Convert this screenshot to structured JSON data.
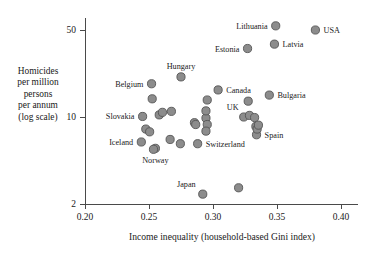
{
  "chart_data": {
    "type": "scatter",
    "title": "",
    "xlabel": "Income inequality (household-based Gini index)",
    "ylabel_lines": [
      "Homicides",
      "per million",
      "persons",
      "per annum",
      "(log scale)"
    ],
    "ylabel": "Homicides per million persons per annum (log scale)",
    "yscale": "log",
    "xscale": "linear",
    "xlim": [
      0.193,
      0.413
    ],
    "ylim": [
      1.85,
      62
    ],
    "xticks": [
      0.2,
      0.25,
      0.3,
      0.35,
      0.4
    ],
    "xtick_labels": [
      "0.20",
      "0.25",
      "0.30",
      "0.35",
      "0.40"
    ],
    "yticks": [
      2,
      10,
      50
    ],
    "ytick_labels": [
      "2",
      "10",
      "50"
    ],
    "grid": false,
    "legend": "none",
    "marker_color": "#8c8c8c",
    "marker_edge_color": "#555555",
    "marker_radius": 4.1,
    "points": [
      {
        "label": "Lithuania",
        "x": 0.349,
        "y": 54.0,
        "label_pos": "left"
      },
      {
        "label": "USA",
        "x": 0.38,
        "y": 50.0,
        "label_pos": "right"
      },
      {
        "label": "Latvia",
        "x": 0.348,
        "y": 38.5,
        "label_pos": "right"
      },
      {
        "label": "Estonia",
        "x": 0.327,
        "y": 35.5,
        "label_pos": "left"
      },
      {
        "label": "Hungary",
        "x": 0.275,
        "y": 21.0,
        "label_pos": "above"
      },
      {
        "label": "Belgium",
        "x": 0.252,
        "y": 18.5,
        "label_pos": "left"
      },
      {
        "label": "Canada",
        "x": 0.304,
        "y": 16.5,
        "label_pos": "right"
      },
      {
        "label": "Bulgaria",
        "x": 0.344,
        "y": 15.0,
        "label_pos": "right"
      },
      {
        "label": "Slovakia",
        "x": 0.245,
        "y": 10.1,
        "label_pos": "left"
      },
      {
        "label": "UK",
        "x": 0.324,
        "y": 10.0,
        "label_pos": "above-left"
      },
      {
        "label": "Spain",
        "x": 0.334,
        "y": 7.2,
        "label_pos": "right"
      },
      {
        "label": "Iceland",
        "x": 0.244,
        "y": 6.3,
        "label_pos": "left"
      },
      {
        "label": "Norway",
        "x": 0.255,
        "y": 5.6,
        "label_pos": "below"
      },
      {
        "label": "Switzerland",
        "x": 0.288,
        "y": 6.1,
        "label_pos": "right"
      },
      {
        "label": "Japan",
        "x": 0.292,
        "y": 2.4,
        "label_pos": "above-right"
      },
      {
        "label": "",
        "x": 0.2525,
        "y": 14.0
      },
      {
        "label": "",
        "x": 0.258,
        "y": 10.4
      },
      {
        "label": "",
        "x": 0.2605,
        "y": 10.9
      },
      {
        "label": "",
        "x": 0.2675,
        "y": 11.1
      },
      {
        "label": "",
        "x": 0.2475,
        "y": 8.0
      },
      {
        "label": "",
        "x": 0.2505,
        "y": 7.6
      },
      {
        "label": "",
        "x": 0.2535,
        "y": 5.5
      },
      {
        "label": "",
        "x": 0.2665,
        "y": 6.6
      },
      {
        "label": "",
        "x": 0.2745,
        "y": 6.1
      },
      {
        "label": "",
        "x": 0.2855,
        "y": 9.0
      },
      {
        "label": "",
        "x": 0.2865,
        "y": 8.7
      },
      {
        "label": "",
        "x": 0.2945,
        "y": 9.8
      },
      {
        "label": "",
        "x": 0.2955,
        "y": 8.7
      },
      {
        "label": "",
        "x": 0.2945,
        "y": 7.7
      },
      {
        "label": "",
        "x": 0.2945,
        "y": 11.2
      },
      {
        "label": "",
        "x": 0.2955,
        "y": 13.7
      },
      {
        "label": "",
        "x": 0.3275,
        "y": 13.4
      },
      {
        "label": "",
        "x": 0.3285,
        "y": 10.3
      },
      {
        "label": "",
        "x": 0.3325,
        "y": 9.9
      },
      {
        "label": "",
        "x": 0.3335,
        "y": 8.4
      },
      {
        "label": "",
        "x": 0.3345,
        "y": 8.0
      },
      {
        "label": "",
        "x": 0.3355,
        "y": 8.6
      },
      {
        "label": "",
        "x": 0.32,
        "y": 2.7
      }
    ]
  }
}
